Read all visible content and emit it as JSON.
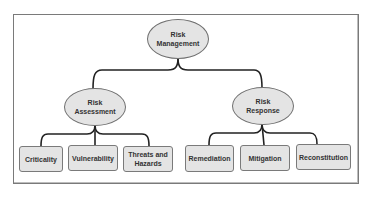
{
  "diagram": {
    "type": "hierarchy-tree",
    "colors": {
      "node_fill": "#e4e4e4",
      "node_border": "#6f6f6f",
      "connector": "#222222",
      "text": "#333333",
      "frame_border": "#7a7a7a"
    },
    "root": {
      "label": "Risk\nManagement"
    },
    "branches": [
      {
        "label": "Risk\nAssessment",
        "children": [
          {
            "label": "Criticality"
          },
          {
            "label": "Vulnerability"
          },
          {
            "label": "Threats and\nHazards"
          }
        ]
      },
      {
        "label": "Risk\nResponse",
        "children": [
          {
            "label": "Remediation"
          },
          {
            "label": "Mitigation"
          },
          {
            "label": "Reconstitution"
          }
        ]
      }
    ]
  }
}
